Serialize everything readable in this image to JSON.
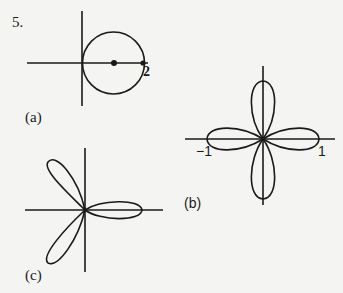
{
  "problem_number": "5.",
  "figures": [
    {
      "id": "a",
      "label": "(a)",
      "description": "circle through origin, center on x-axis, diameter 2",
      "tick_labels": [
        "2"
      ]
    },
    {
      "id": "b",
      "label": "(b)",
      "description": "four-petaled rose",
      "tick_labels": [
        "−1",
        "1"
      ]
    },
    {
      "id": "c",
      "label": "(c)",
      "description": "three-petaled rose",
      "tick_labels": []
    }
  ],
  "colors": {
    "background": "#f4f4f2",
    "ink": "#1a1a1a"
  }
}
